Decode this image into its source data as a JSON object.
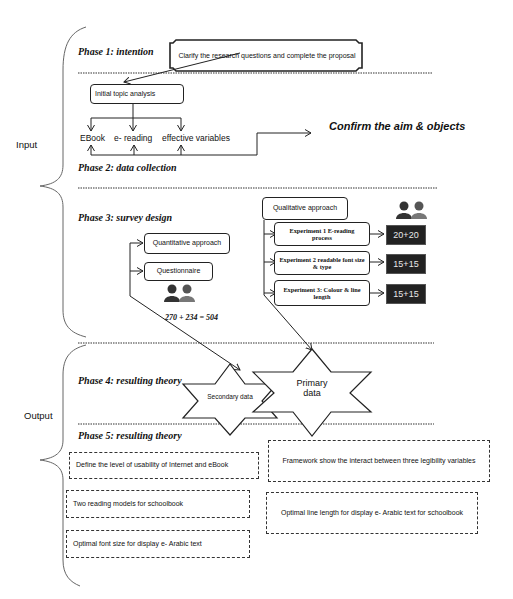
{
  "sections": {
    "input_label": "Input",
    "output_label": "Output"
  },
  "phases": {
    "phase1": "Phase 1: intention",
    "phase2": "Phase 2: data collection",
    "phase3": "Phase 3: survey design",
    "phase4": "Phase 4: resulting theory",
    "phase5": "Phase 5: resulting theory"
  },
  "phase1": {
    "callout": "Clarify the research questions and complete the proposal"
  },
  "phase2": {
    "topic_box": "Initial topic analysis",
    "variables": [
      "EBook",
      "e- reading",
      "effective variables"
    ],
    "confirm": "Confirm the aim & objects"
  },
  "phase3": {
    "quantitative": {
      "approach": "Quantitative approach",
      "method": "Questionnaire",
      "participants_icon": "people-icon",
      "formula": "270 + 234  = 504"
    },
    "qualitative": {
      "approach": "Qualitative approach",
      "participants_icon": "people-icon",
      "experiments": [
        {
          "label": "Experiment 1 E-reading process",
          "count": "20+20"
        },
        {
          "label": "Experiment 2 readable font size & type",
          "count": "15+15"
        },
        {
          "label": "Experiment 3: Colour & line length",
          "count": "15+15"
        }
      ]
    }
  },
  "phase4": {
    "secondary": "Secondary data",
    "primary": "Primary data"
  },
  "phase5": {
    "outcomes_left": [
      "Define the level of usability of Internet and eBook",
      "Two reading models for schoolbook",
      "Optimal font size for display e- Arabic text"
    ],
    "outcomes_right": [
      "Framework show the interact between three legibility variables",
      "Optimal line length for display e- Arabic text for schoolbook"
    ]
  },
  "colors": {
    "line": "#222222",
    "dark_box": "#222222",
    "background": "#ffffff"
  }
}
